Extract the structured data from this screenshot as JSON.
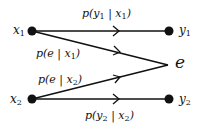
{
  "diagram": {
    "type": "channel-transition-diagram",
    "nodes": [
      {
        "id": "x1",
        "label": "x",
        "sub": "1"
      },
      {
        "id": "y1",
        "label": "y",
        "sub": "1"
      },
      {
        "id": "x2",
        "label": "x",
        "sub": "2"
      },
      {
        "id": "y2",
        "label": "y",
        "sub": "2"
      },
      {
        "id": "e",
        "label": "e"
      }
    ],
    "edges": [
      {
        "from": "x1",
        "to": "y1",
        "label": "p(y1 | x1)"
      },
      {
        "from": "x1",
        "to": "e",
        "label": "p(e | x1)"
      },
      {
        "from": "x2",
        "to": "e",
        "label": "p(e | x2)"
      },
      {
        "from": "x2",
        "to": "y2",
        "label": "p(y2 | x2)"
      }
    ],
    "edge_labels": {
      "y1x1": {
        "pre": "p(y",
        "s1": "1",
        "mid": " | x",
        "s2": "1",
        "post": ")"
      },
      "ex1": {
        "pre": "p(e | x",
        "s1": "1",
        "post": ")"
      },
      "ex2": {
        "pre": "p(e | x",
        "s1": "2",
        "post": ")"
      },
      "y2x2": {
        "pre": "p(y",
        "s1": "2",
        "mid": " | x",
        "s2": "2",
        "post": ")"
      }
    },
    "colors": {
      "line": "#111111",
      "background": "#ffffff"
    }
  }
}
